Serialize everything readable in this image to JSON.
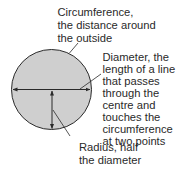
{
  "diagram": {
    "colors": {
      "circle_fill": "#cfcfcf",
      "stroke": "#2a2a2a",
      "text": "#2a2a2a",
      "background": "#ffffff"
    },
    "labels": {
      "circumference": {
        "lines": [
          "Circumference,",
          "the distance around",
          "the outside"
        ]
      },
      "diameter": {
        "lines": [
          "Diameter, the",
          "length of a line",
          "that passes",
          "through the",
          "centre and",
          "touches the",
          "circumference",
          "at two points"
        ]
      },
      "radius": {
        "lines": [
          "Radius, half",
          "the diameter"
        ]
      }
    }
  }
}
